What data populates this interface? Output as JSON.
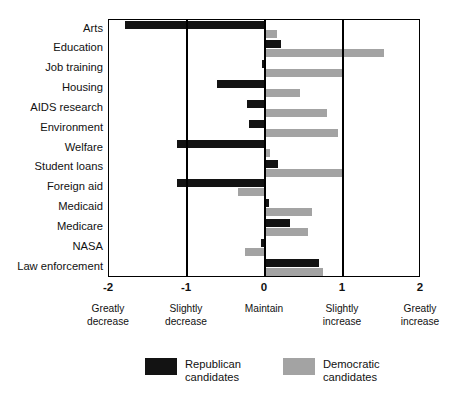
{
  "chart_data": {
    "type": "bar",
    "orientation": "horizontal",
    "title": "",
    "xlabel": "",
    "ylabel": "",
    "xlim": [
      -2,
      2
    ],
    "grid": true,
    "gridlines": [
      -2,
      -1,
      0,
      1,
      2
    ],
    "tick_labels": [
      "-2",
      "-1",
      "0",
      "1",
      "2"
    ],
    "tick_values": [
      -2,
      -1,
      0,
      1,
      2
    ],
    "scale_anchors": [
      {
        "value": -2,
        "line1": "Greatly",
        "line2": "decrease"
      },
      {
        "value": -1,
        "line1": "Slightly",
        "line2": "decrease"
      },
      {
        "value": 0,
        "line1": "Maintain",
        "line2": ""
      },
      {
        "value": 1,
        "line1": "Slightly",
        "line2": "increase"
      },
      {
        "value": 2,
        "line1": "Greatly",
        "line2": "increase"
      }
    ],
    "categories": [
      "Arts",
      "Education",
      "Job training",
      "Housing",
      "AIDS research",
      "Environment",
      "Welfare",
      "Student loans",
      "Foreign aid",
      "Medicaid",
      "Medicare",
      "NASA",
      "Law enforcement"
    ],
    "series": [
      {
        "name": "Republican candidates",
        "color": "#131313",
        "values": [
          -1.8,
          0.21,
          -0.04,
          -0.61,
          -0.23,
          -0.21,
          -1.13,
          0.17,
          -1.13,
          0.05,
          0.32,
          -0.05,
          0.69
        ]
      },
      {
        "name": "Democratic candidates",
        "color": "#a3a3a3",
        "values": [
          0.15,
          1.52,
          1.0,
          0.45,
          0.79,
          0.93,
          0.06,
          1.0,
          -0.34,
          0.6,
          0.55,
          -0.26,
          0.74
        ]
      }
    ],
    "legend": {
      "position": "bottom",
      "entries": [
        {
          "label_line1": "Republican",
          "label_line2": "candidates",
          "color": "#131313"
        },
        {
          "label_line1": "Democratic",
          "label_line2": "candidates",
          "color": "#a3a3a3"
        }
      ]
    }
  }
}
